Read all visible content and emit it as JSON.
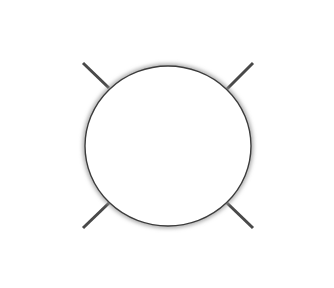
{
  "figure": {
    "background": "#ffffff",
    "ray_color": "#4a4a4a",
    "circle_stroke": "#3c3c3c",
    "circle_fill": "#ffffff",
    "shadow_color": "#9a9a9a",
    "circle": {
      "cx": 168,
      "cy": 146,
      "rx": 83,
      "ry": 80
    },
    "rays": [
      {
        "name": "ray-top",
        "x1": 168,
        "y1": 19,
        "x2": 168,
        "y2": 66
      },
      {
        "name": "ray-top-right",
        "x1": 227,
        "y1": 89,
        "x2": 253,
        "y2": 63
      },
      {
        "name": "ray-right",
        "x1": 251,
        "y1": 146,
        "x2": 318,
        "y2": 146
      },
      {
        "name": "ray-bottom-right",
        "x1": 227,
        "y1": 203,
        "x2": 253,
        "y2": 228
      },
      {
        "name": "ray-bottom",
        "x1": 168,
        "y1": 226,
        "x2": 168,
        "y2": 272
      },
      {
        "name": "ray-bottom-left",
        "x1": 109,
        "y1": 203,
        "x2": 83,
        "y2": 228
      },
      {
        "name": "ray-left",
        "x1": 18,
        "y1": 146,
        "x2": 85,
        "y2": 146
      },
      {
        "name": "ray-top-left",
        "x1": 83,
        "y1": 63,
        "x2": 109,
        "y2": 88
      }
    ]
  }
}
